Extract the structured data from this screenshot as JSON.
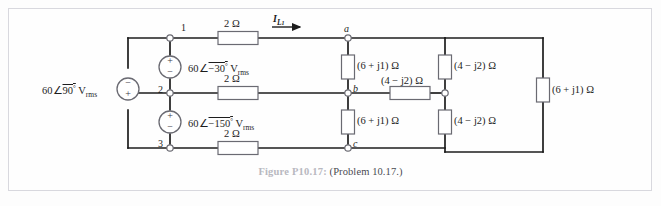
{
  "page": {
    "background": "#fdfdfd",
    "border_color": "#d8d8de",
    "top_partial_text": "",
    "wire_color": "#1d1d1d",
    "component_fill": "#ffffff",
    "component_stroke": "#5a5a62"
  },
  "caption": {
    "label": "Figure P10.17:",
    "text": "(Problem 10.17.)",
    "label_color": "#b8b8c0",
    "text_color": "#4a4a52"
  },
  "figure": {
    "type": "circuit-schematic"
  },
  "sources": [
    {
      "id": "source-left",
      "label_magnitude": "60",
      "label_angle": "90",
      "label_angle_symbol": "°",
      "label_unit": "V",
      "label_unit_sub": "rms",
      "full_label": "60∠90° V rms",
      "polarity_top": "−",
      "polarity_bottom": "+",
      "orientation": "vertical"
    },
    {
      "id": "source-upper-middle",
      "label_magnitude": "60",
      "label_angle": "−30",
      "label_angle_symbol": "°",
      "label_unit": "V",
      "label_unit_sub": "rms",
      "full_label": "60∠−30° V rms",
      "polarity_top": "+",
      "polarity_bottom": "−",
      "orientation": "vertical"
    },
    {
      "id": "source-lower-middle",
      "label_magnitude": "60",
      "label_angle": "−150",
      "label_angle_symbol": "°",
      "label_unit": "V",
      "label_unit_sub": "rms",
      "full_label": "60∠−150° V rms",
      "polarity_top": "+",
      "polarity_bottom": "−",
      "orientation": "vertical"
    }
  ],
  "line_resistors": [
    {
      "id": "line-resistor-top",
      "value": "2 Ω",
      "orientation": "horizontal"
    },
    {
      "id": "line-resistor-middle",
      "value": "2 Ω",
      "orientation": "horizontal"
    },
    {
      "id": "line-resistor-bottom",
      "value": "2 Ω",
      "orientation": "horizontal"
    }
  ],
  "impedances": [
    {
      "id": "impedance-a-b",
      "value": "(6 + j1) Ω",
      "orientation": "vertical",
      "branch": "a-b"
    },
    {
      "id": "impedance-b-c",
      "value": "(6 + j1) Ω",
      "orientation": "vertical",
      "branch": "b-c"
    },
    {
      "id": "impedance-b-series",
      "value": "(4 − j2) Ω",
      "orientation": "horizontal",
      "branch": "b-to-mid"
    },
    {
      "id": "impedance-mid-upper",
      "value": "(4 − j2) Ω",
      "orientation": "vertical",
      "branch": "top-to-mid"
    },
    {
      "id": "impedance-mid-lower",
      "value": "(4 − j2) Ω",
      "orientation": "vertical",
      "branch": "mid-to-bottom"
    },
    {
      "id": "impedance-right",
      "value": "(6 + j1) Ω",
      "orientation": "vertical",
      "branch": "far-right"
    }
  ],
  "nodes": [
    {
      "id": "node-1",
      "label": "1",
      "style": "numeric"
    },
    {
      "id": "node-2",
      "label": "2",
      "style": "numeric"
    },
    {
      "id": "node-3",
      "label": "3",
      "style": "numeric"
    },
    {
      "id": "node-a",
      "label": "a",
      "style": "italic"
    },
    {
      "id": "node-b",
      "label": "b",
      "style": "italic"
    },
    {
      "id": "node-c",
      "label": "c",
      "style": "italic"
    }
  ],
  "currents": [
    {
      "id": "current-IL1",
      "symbol": "I",
      "subscript": "L",
      "subscript2": "1",
      "full_label": "I L1",
      "direction": "right"
    }
  ]
}
